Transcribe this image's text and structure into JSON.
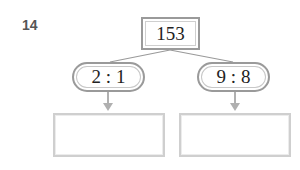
{
  "question": {
    "number": "14"
  },
  "diagram": {
    "root": {
      "value": "153"
    },
    "branches": [
      {
        "ratio": "2 : 1",
        "answer": ""
      },
      {
        "ratio": "9 : 8",
        "answer": ""
      }
    ],
    "colors": {
      "border": "#9a9a9a",
      "answer_border": "#cfcfcf",
      "connector": "#9a9a9a",
      "arrow": "#b0b0b0"
    }
  }
}
